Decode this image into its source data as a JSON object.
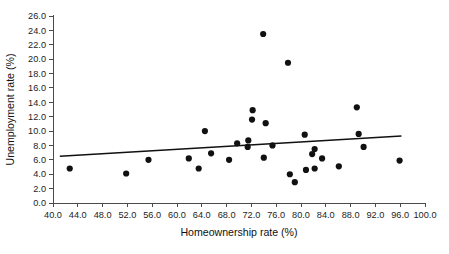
{
  "chart_data": {
    "type": "scatter",
    "title": "",
    "xlabel": "Homeownership rate (%)",
    "ylabel": "Unemployment rate (%)",
    "xlim": [
      40.0,
      100.0
    ],
    "ylim": [
      0.0,
      26.0
    ],
    "xticks": [
      40.0,
      44.0,
      48.0,
      52.0,
      56.0,
      60.0,
      64.0,
      68.0,
      72.0,
      76.0,
      80.0,
      84.0,
      88.0,
      92.0,
      96.0,
      100.0
    ],
    "xtick_labels": [
      "40.0",
      "44.0",
      "48.0",
      "52.0",
      "56.0",
      "60.0",
      "64.0",
      "68.0",
      "72.0",
      "76.0",
      "80.0",
      "84.0",
      "88.0",
      "92.0",
      "96.0",
      "100.0"
    ],
    "yticks": [
      0.0,
      2.0,
      4.0,
      6.0,
      8.0,
      10.0,
      12.0,
      14.0,
      16.0,
      18.0,
      20.0,
      22.0,
      24.0,
      26.0
    ],
    "ytick_labels": [
      "0.0",
      "2.0",
      "4.0",
      "6.0",
      "8.0",
      "10.0",
      "12.0",
      "14.0",
      "16.0",
      "18.0",
      "20.0",
      "22.0",
      "24.0",
      "26.0"
    ],
    "grid": false,
    "legend": false,
    "marker_color": "#111111",
    "marker_size": 3.1,
    "points": [
      {
        "x": 42.7,
        "y": 4.8
      },
      {
        "x": 51.8,
        "y": 4.1
      },
      {
        "x": 55.4,
        "y": 6.0
      },
      {
        "x": 61.9,
        "y": 6.2
      },
      {
        "x": 63.5,
        "y": 4.8
      },
      {
        "x": 64.5,
        "y": 10.0
      },
      {
        "x": 65.5,
        "y": 6.9
      },
      {
        "x": 68.4,
        "y": 6.0
      },
      {
        "x": 69.7,
        "y": 8.3
      },
      {
        "x": 71.5,
        "y": 8.7
      },
      {
        "x": 71.4,
        "y": 7.8
      },
      {
        "x": 72.2,
        "y": 12.9
      },
      {
        "x": 72.1,
        "y": 11.6
      },
      {
        "x": 73.9,
        "y": 23.5
      },
      {
        "x": 74.3,
        "y": 11.1
      },
      {
        "x": 74.0,
        "y": 6.3
      },
      {
        "x": 75.4,
        "y": 8.0
      },
      {
        "x": 77.9,
        "y": 19.5
      },
      {
        "x": 78.2,
        "y": 4.0
      },
      {
        "x": 79.0,
        "y": 2.9
      },
      {
        "x": 80.6,
        "y": 9.5
      },
      {
        "x": 80.8,
        "y": 4.6
      },
      {
        "x": 81.8,
        "y": 6.8
      },
      {
        "x": 82.2,
        "y": 7.5
      },
      {
        "x": 82.2,
        "y": 4.8
      },
      {
        "x": 83.4,
        "y": 6.2
      },
      {
        "x": 86.1,
        "y": 5.1
      },
      {
        "x": 89.0,
        "y": 13.3
      },
      {
        "x": 89.3,
        "y": 9.6
      },
      {
        "x": 90.1,
        "y": 7.8
      },
      {
        "x": 95.9,
        "y": 5.9
      }
    ],
    "trend_line": {
      "x_start": 41.1,
      "y_start": 6.5,
      "x_end": 96.2,
      "y_end": 9.3,
      "color": "#111111"
    }
  }
}
